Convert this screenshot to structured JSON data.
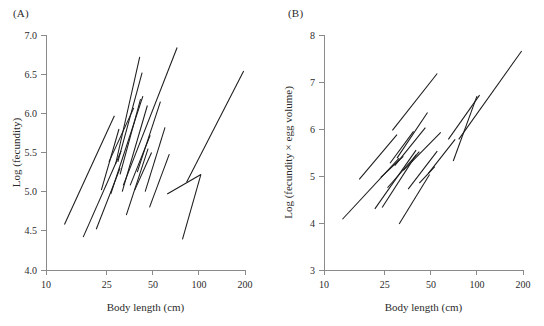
{
  "figure": {
    "panels": [
      {
        "id": "A",
        "label": "(A)",
        "xlabel": "Body length (cm)",
        "ylabel": "Log (fecundity)"
      },
      {
        "id": "B",
        "label": "(B)",
        "xlabel": "Body length (cm)",
        "ylabel": "Log (fecundity × egg volume)"
      }
    ]
  },
  "chart_data": [
    {
      "type": "line",
      "title": "(A)",
      "xlabel": "Body length (cm)",
      "ylabel": "Log (fecundity)",
      "xscale": "log",
      "yscale": "linear",
      "xlim": [
        10,
        200
      ],
      "ylim": [
        4.0,
        7.0
      ],
      "xticks": [
        10,
        25,
        50,
        100,
        200
      ],
      "xticklabels": [
        "10",
        "25",
        "50",
        "100",
        "200"
      ],
      "yticks": [
        4.0,
        4.5,
        5.0,
        5.5,
        6.0,
        6.5,
        7.0
      ],
      "yticklabels": [
        "4.0",
        "4.5",
        "5.0",
        "5.5",
        "6.0",
        "6.5",
        "7.0"
      ],
      "grid": false,
      "legend": "none",
      "series": [
        {
          "name": "line-01",
          "x": [
            13.2,
            28.0
          ],
          "y": [
            4.58,
            5.97
          ]
        },
        {
          "name": "line-02",
          "x": [
            17.5,
            31.0
          ],
          "y": [
            4.42,
            5.52
          ]
        },
        {
          "name": "line-03",
          "x": [
            21.3,
            30.5
          ],
          "y": [
            4.52,
            5.3
          ]
        },
        {
          "name": "line-04",
          "x": [
            23.0,
            30.0
          ],
          "y": [
            5.02,
            5.8
          ]
        },
        {
          "name": "line-05",
          "x": [
            25.8,
            37.5
          ],
          "y": [
            5.38,
            6.07
          ]
        },
        {
          "name": "line-06",
          "x": [
            26.5,
            43.0
          ],
          "y": [
            4.97,
            6.22
          ]
        },
        {
          "name": "line-07",
          "x": [
            28.5,
            41.0
          ],
          "y": [
            5.35,
            6.72
          ]
        },
        {
          "name": "line-08",
          "x": [
            29.5,
            42.5
          ],
          "y": [
            5.38,
            6.52
          ]
        },
        {
          "name": "line-09",
          "x": [
            30.5,
            41.5
          ],
          "y": [
            5.22,
            6.18
          ]
        },
        {
          "name": "line-10",
          "x": [
            31.5,
            46.0
          ],
          "y": [
            5.0,
            6.1
          ]
        },
        {
          "name": "line-11",
          "x": [
            32.0,
            72.0
          ],
          "y": [
            5.08,
            6.84
          ]
        },
        {
          "name": "line-12",
          "x": [
            33.5,
            46.5
          ],
          "y": [
            4.7,
            5.55
          ]
        },
        {
          "name": "line-13",
          "x": [
            35.5,
            48.0
          ],
          "y": [
            5.08,
            5.72
          ]
        },
        {
          "name": "line-14",
          "x": [
            38.0,
            49.0
          ],
          "y": [
            5.02,
            5.5
          ]
        },
        {
          "name": "line-15",
          "x": [
            39.5,
            56.0
          ],
          "y": [
            5.25,
            6.15
          ]
        },
        {
          "name": "line-16",
          "x": [
            44.5,
            60.0
          ],
          "y": [
            5.0,
            5.82
          ]
        },
        {
          "name": "line-17",
          "x": [
            47.5,
            64.0
          ],
          "y": [
            4.8,
            5.48
          ]
        },
        {
          "name": "line-18",
          "x": [
            62.0,
            103.0
          ],
          "y": [
            4.97,
            5.22
          ]
        },
        {
          "name": "line-19",
          "x": [
            78.0,
            103.0
          ],
          "y": [
            4.39,
            5.22
          ]
        },
        {
          "name": "line-20",
          "x": [
            83.0,
            196.0
          ],
          "y": [
            5.12,
            6.54
          ]
        }
      ]
    },
    {
      "type": "line",
      "title": "(B)",
      "xlabel": "Body length (cm)",
      "ylabel": "Log (fecundity × egg volume)",
      "xscale": "log",
      "yscale": "linear",
      "xlim": [
        10,
        200
      ],
      "ylim": [
        3,
        8
      ],
      "xticks": [
        10,
        25,
        50,
        100,
        200
      ],
      "xticklabels": [
        "10",
        "25",
        "50",
        "100",
        "200"
      ],
      "yticks": [
        3,
        4,
        5,
        6,
        7,
        8
      ],
      "yticklabels": [
        "3",
        "4",
        "5",
        "6",
        "7",
        "8"
      ],
      "grid": false,
      "legend": "none",
      "series": [
        {
          "name": "line-01",
          "x": [
            13.2,
            31.0
          ],
          "y": [
            4.08,
            5.38
          ]
        },
        {
          "name": "line-02",
          "x": [
            17.0,
            30.0
          ],
          "y": [
            4.93,
            5.88
          ]
        },
        {
          "name": "line-03",
          "x": [
            21.5,
            40.0
          ],
          "y": [
            4.3,
            5.55
          ]
        },
        {
          "name": "line-04",
          "x": [
            23.5,
            33.0
          ],
          "y": [
            4.97,
            5.42
          ]
        },
        {
          "name": "line-05",
          "x": [
            24.0,
            40.0
          ],
          "y": [
            4.33,
            5.45
          ]
        },
        {
          "name": "line-06",
          "x": [
            26.0,
            42.0
          ],
          "y": [
            4.75,
            5.52
          ]
        },
        {
          "name": "line-07",
          "x": [
            27.0,
            38.5
          ],
          "y": [
            5.27,
            5.95
          ]
        },
        {
          "name": "line-08",
          "x": [
            28.0,
            55.0
          ],
          "y": [
            5.97,
            7.18
          ]
        },
        {
          "name": "line-09",
          "x": [
            29.0,
            46.0
          ],
          "y": [
            5.22,
            6.03
          ]
        },
        {
          "name": "line-10",
          "x": [
            30.0,
            47.5
          ],
          "y": [
            5.38,
            6.35
          ]
        },
        {
          "name": "line-11",
          "x": [
            31.0,
            49.0
          ],
          "y": [
            3.98,
            5.03
          ]
        },
        {
          "name": "line-12",
          "x": [
            33.0,
            58.0
          ],
          "y": [
            5.12,
            5.93
          ]
        },
        {
          "name": "line-13",
          "x": [
            35.5,
            55.0
          ],
          "y": [
            4.72,
            5.53
          ]
        },
        {
          "name": "line-14",
          "x": [
            42.0,
            53.0
          ],
          "y": [
            4.85,
            5.2
          ]
        },
        {
          "name": "line-15",
          "x": [
            48.0,
            72.0
          ],
          "y": [
            5.05,
            5.78
          ]
        },
        {
          "name": "line-16",
          "x": [
            65.0,
            104.0
          ],
          "y": [
            5.78,
            6.72
          ]
        },
        {
          "name": "line-17",
          "x": [
            70.0,
            100.0
          ],
          "y": [
            5.32,
            6.7
          ]
        },
        {
          "name": "line-18",
          "x": [
            76.0,
            196.0
          ],
          "y": [
            5.78,
            7.66
          ]
        }
      ]
    }
  ]
}
